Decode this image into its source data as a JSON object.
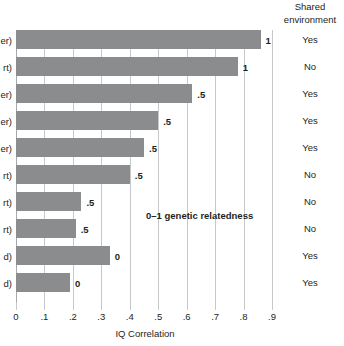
{
  "chart_data": {
    "type": "bar",
    "orientation": "horizontal",
    "title": "",
    "xlabel": "IQ Correlation",
    "ylabel": "",
    "xlim": [
      0,
      0.9
    ],
    "grid": true,
    "legend": "none",
    "annotation": "0–1 genetic relatedness",
    "tick_labels": [
      "0",
      ".1",
      ".2",
      ".3",
      ".4",
      ".5",
      ".6",
      ".7",
      ".8",
      ".9"
    ],
    "tick_values": [
      0,
      0.1,
      0.2,
      0.3,
      0.4,
      0.5,
      0.6,
      0.7,
      0.8,
      0.9
    ],
    "categories": [
      "er)",
      "rt)",
      "er)",
      "er)",
      "er)",
      "rt)",
      "rt)",
      "rt)",
      "d)",
      "d)"
    ],
    "values": [
      0.86,
      0.78,
      0.62,
      0.5,
      0.45,
      0.4,
      0.23,
      0.21,
      0.33,
      0.19
    ],
    "point_labels": [
      "1",
      "1",
      ".5",
      ".5",
      ".5",
      ".5",
      ".5",
      ".5",
      "0",
      "0"
    ],
    "bar_color": "#8b8c8e",
    "grid_color": "#c7c8ca",
    "text_color": "#231f20"
  },
  "columns": {
    "shared_environment": {
      "header_line1": "Shared",
      "header_line2": "environment",
      "values": [
        "Yes",
        "No",
        "Yes",
        "Yes",
        "Yes",
        "No",
        "No",
        "No",
        "Yes",
        "Yes"
      ]
    }
  }
}
